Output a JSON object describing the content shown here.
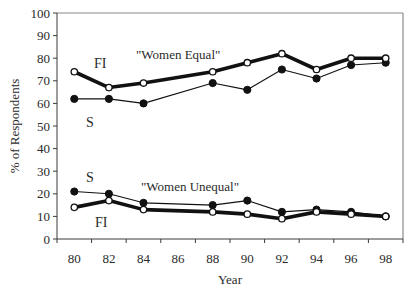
{
  "chart_data": {
    "type": "line",
    "title": "",
    "xlabel": "Year",
    "ylabel": "% of Respondents",
    "ylim": [
      0,
      100
    ],
    "yticks": [
      0,
      10,
      20,
      30,
      40,
      50,
      60,
      70,
      80,
      90,
      100
    ],
    "categories": [
      "80",
      "82",
      "84",
      "86",
      "88",
      "90",
      "92",
      "94",
      "96",
      "98"
    ],
    "grid": false,
    "legend": "inline labels",
    "groups": [
      {
        "label": "\"Women Equal\"",
        "series": [
          {
            "name": "FI",
            "style": "thick line, open circle markers",
            "x": [
              "80",
              "82",
              "84",
              "88",
              "90",
              "92",
              "94",
              "96",
              "98"
            ],
            "values": [
              74,
              67,
              69,
              74,
              78,
              82,
              75,
              80,
              80
            ]
          },
          {
            "name": "S",
            "style": "thin line, filled circle markers",
            "x": [
              "80",
              "82",
              "84",
              "88",
              "90",
              "92",
              "94",
              "96",
              "98"
            ],
            "values": [
              62,
              62,
              60,
              69,
              66,
              75,
              71,
              77,
              78
            ]
          }
        ]
      },
      {
        "label": "\"Women Unequal\"",
        "series": [
          {
            "name": "S",
            "style": "thin line, filled circle markers",
            "x": [
              "80",
              "82",
              "84",
              "88",
              "90",
              "92",
              "94",
              "96",
              "98"
            ],
            "values": [
              21,
              20,
              16,
              15,
              17,
              12,
              13,
              12,
              10
            ]
          },
          {
            "name": "FI",
            "style": "thick line, open circle markers",
            "x": [
              "80",
              "82",
              "84",
              "88",
              "90",
              "92",
              "94",
              "96",
              "98"
            ],
            "values": [
              14,
              17,
              13,
              12,
              11,
              9,
              12,
              11,
              10
            ]
          }
        ]
      }
    ],
    "annotations": [
      {
        "text": "FI",
        "x": 94,
        "y": 68,
        "class": "series-tag"
      },
      {
        "text": "S",
        "x": 86,
        "y": 127,
        "class": "series-tag"
      },
      {
        "text": "\"Women Equal\"",
        "x": 136,
        "y": 59,
        "class": "annot"
      },
      {
        "text": "S",
        "x": 86,
        "y": 182,
        "class": "series-tag"
      },
      {
        "text": "FI",
        "x": 95,
        "y": 227,
        "class": "series-tag"
      },
      {
        "text": "\"Women Unequal\"",
        "x": 141,
        "y": 191,
        "class": "annot"
      }
    ]
  },
  "layout": {
    "plot": {
      "left": 57,
      "right": 403,
      "top": 13,
      "bottom": 239
    },
    "colors": {
      "frame": "#8a8a8a",
      "axis": "#3a3a3a",
      "line": "#111111",
      "marker_open_fill": "#ffffff"
    }
  }
}
